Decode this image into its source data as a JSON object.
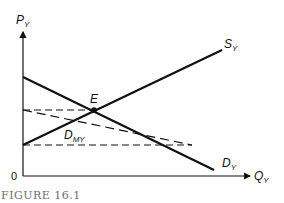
{
  "figure": {
    "caption": "FIGURE 16.1",
    "origin_label": "0"
  },
  "axes": {
    "y_label_main": "P",
    "y_label_sub": "Y",
    "x_label_main": "Q",
    "x_label_sub": "Y"
  },
  "curves": {
    "supply": {
      "main": "S",
      "sub": "Y"
    },
    "demand": {
      "main": "D",
      "sub": "Y"
    },
    "marginal": {
      "main": "D",
      "sub": "MY"
    },
    "equilibrium": "E"
  },
  "colors": {
    "line": "#111111",
    "caption": "#6e6e6e"
  }
}
